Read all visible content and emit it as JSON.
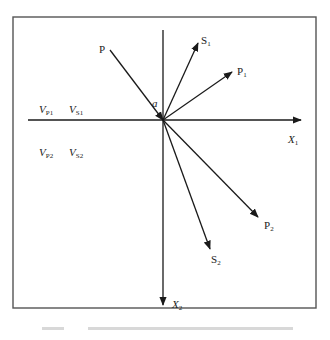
{
  "diagram": {
    "type": "wave reflection/refraction vector diagram",
    "frame": {
      "x": 13,
      "y": 17,
      "width": 303,
      "height": 291,
      "stroke": "#555555"
    },
    "origin": {
      "x": 163,
      "y": 120
    },
    "axes": {
      "x1": {
        "label_main": "X",
        "label_sub": "1",
        "from": [
          28,
          120
        ],
        "to": [
          301,
          120
        ]
      },
      "x2": {
        "label_main": "X",
        "label_sub": "2",
        "from": [
          163,
          30
        ],
        "to": [
          163,
          305
        ]
      }
    },
    "incident_angle_label": "a",
    "rays": [
      {
        "name": "P",
        "label_main": "P",
        "label_sub": "",
        "from": [
          110,
          50
        ],
        "to": [
          163,
          120
        ],
        "kind": "incident"
      },
      {
        "name": "S1",
        "label_main": "S",
        "label_sub": "1",
        "from": [
          163,
          120
        ],
        "to": [
          198,
          43
        ],
        "kind": "reflected"
      },
      {
        "name": "P1",
        "label_main": "P",
        "label_sub": "1",
        "from": [
          163,
          120
        ],
        "to": [
          232,
          72
        ],
        "kind": "reflected"
      },
      {
        "name": "P2",
        "label_main": "P",
        "label_sub": "2",
        "from": [
          163,
          120
        ],
        "to": [
          258,
          217
        ],
        "kind": "refracted"
      },
      {
        "name": "S2",
        "label_main": "S",
        "label_sub": "2",
        "from": [
          163,
          120
        ],
        "to": [
          210,
          249
        ],
        "kind": "refracted"
      }
    ],
    "medium_labels": {
      "upper": [
        {
          "main": "V",
          "sub": "P1"
        },
        {
          "main": "V",
          "sub": "S1"
        }
      ],
      "lower": [
        {
          "main": "V",
          "sub": "P2"
        },
        {
          "main": "V",
          "sub": "S2"
        }
      ]
    },
    "line_color": "#1a1a1a"
  }
}
